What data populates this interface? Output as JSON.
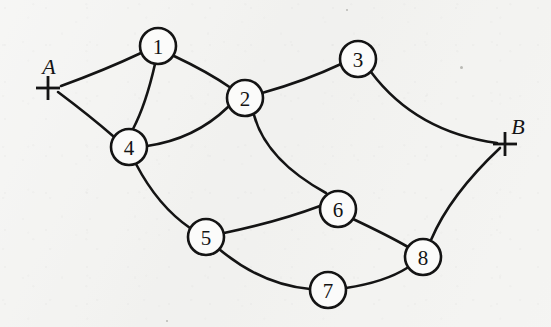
{
  "diagram": {
    "background_color": "#f3f3f1",
    "ink_color": "#141414",
    "width": 551,
    "height": 327,
    "node_radius": 18,
    "terminals": [
      {
        "id": "A",
        "label": "A",
        "x": 48,
        "y": 88,
        "label_x": 49,
        "label_y": 66,
        "arm": 12
      },
      {
        "id": "B",
        "label": "B",
        "x": 505,
        "y": 144,
        "label_x": 518,
        "label_y": 126,
        "arm": 12
      }
    ],
    "nodes": [
      {
        "id": "1",
        "label": "1",
        "x": 158,
        "y": 46
      },
      {
        "id": "2",
        "label": "2",
        "x": 245,
        "y": 98
      },
      {
        "id": "3",
        "label": "3",
        "x": 358,
        "y": 59
      },
      {
        "id": "4",
        "label": "4",
        "x": 129,
        "y": 147
      },
      {
        "id": "5",
        "label": "5",
        "x": 206,
        "y": 237
      },
      {
        "id": "6",
        "label": "6",
        "x": 338,
        "y": 209
      },
      {
        "id": "7",
        "label": "7",
        "x": 328,
        "y": 290
      },
      {
        "id": "8",
        "label": "8",
        "x": 423,
        "y": 257
      }
    ],
    "edges": [
      {
        "id": "A-1",
        "from": "A",
        "to": "1",
        "path": "M 61 86 Q 105 70 141 53"
      },
      {
        "id": "A-4",
        "from": "A",
        "to": "4",
        "path": "M 58 92 Q 90 116 113 136"
      },
      {
        "id": "1-4",
        "from": "1",
        "to": "4",
        "path": "M 155 64 Q 146 104 133 129"
      },
      {
        "id": "1-2",
        "from": "1",
        "to": "2",
        "path": "M 174 56 Q 208 72 231 88"
      },
      {
        "id": "4-2",
        "from": "4",
        "to": "2",
        "path": "M 147 146 Q 195 139 228 107"
      },
      {
        "id": "2-3",
        "from": "2",
        "to": "3",
        "path": "M 262 93 Q 305 81 341 64"
      },
      {
        "id": "2-6",
        "from": "2",
        "to": "6",
        "path": "M 254 115 Q 266 160 326 193"
      },
      {
        "id": "3-B",
        "from": "3",
        "to": "B",
        "path": "M 371 72 Q 416 132 497 143"
      },
      {
        "id": "4-5",
        "from": "4",
        "to": "5",
        "path": "M 136 164 Q 158 206 190 228"
      },
      {
        "id": "5-6",
        "from": "5",
        "to": "6",
        "path": "M 224 233 Q 277 222 320 206"
      },
      {
        "id": "5-7",
        "from": "5",
        "to": "7",
        "path": "M 219 249 Q 262 285 310 289"
      },
      {
        "id": "6-8",
        "from": "6",
        "to": "8",
        "path": "M 353 219 Q 389 236 408 247"
      },
      {
        "id": "7-8",
        "from": "7",
        "to": "8",
        "path": "M 346 288 Q 385 282 407 268"
      },
      {
        "id": "8-B",
        "from": "8",
        "to": "B",
        "path": "M 431 240 Q 450 195 500 148"
      }
    ],
    "specks": [
      {
        "x": 460,
        "y": 66,
        "size": 3
      },
      {
        "x": 346,
        "y": 9,
        "size": 2
      },
      {
        "x": 166,
        "y": 320,
        "size": 2
      }
    ]
  }
}
